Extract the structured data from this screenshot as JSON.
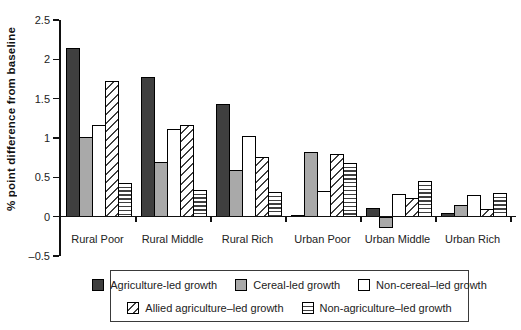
{
  "chart_data": {
    "type": "bar",
    "title": "",
    "xlabel": "",
    "ylabel": "% point difference from baseline",
    "categories": [
      "Rural Poor",
      "Rural Middle",
      "Rural Rich",
      "Urban Poor",
      "Urban Middle",
      "Urban Rich"
    ],
    "series": [
      {
        "name": "Agriculture-led growth",
        "pattern": "solid-dark",
        "color": "#3f3f3f",
        "values": [
          2.15,
          1.78,
          1.44,
          0.03,
          0.12,
          0.05
        ]
      },
      {
        "name": "Cereal-led growth",
        "pattern": "solid-gray",
        "color": "#a9a9a9",
        "values": [
          1.02,
          0.71,
          0.6,
          0.83,
          -0.15,
          0.16
        ]
      },
      {
        "name": "Non-cereal–led growth",
        "pattern": "white",
        "color": "#ffffff",
        "values": [
          1.17,
          1.13,
          1.04,
          0.33,
          0.3,
          0.28
        ]
      },
      {
        "name": "Allied agriculture–led growth",
        "pattern": "diagonal",
        "color": "#ffffff",
        "values": [
          1.73,
          1.17,
          0.77,
          0.81,
          0.25,
          0.11
        ]
      },
      {
        "name": "Non-agriculture–led growth",
        "pattern": "hlines",
        "color": "#ffffff",
        "values": [
          0.44,
          0.35,
          0.32,
          0.69,
          0.46,
          0.31
        ]
      }
    ],
    "yticks": [
      2.5,
      2,
      1.5,
      1,
      0.5,
      0,
      -0.5
    ],
    "ytick_labels": [
      "2.5",
      "2",
      "1.5",
      "1",
      "0.5",
      "0",
      "–0.5"
    ],
    "ylim": [
      -0.5,
      2.5
    ],
    "grid": false,
    "legend_position": "bottom",
    "legend_rows": [
      [
        0,
        1,
        2
      ],
      [
        3,
        4
      ]
    ],
    "axis_color": "#111111"
  }
}
